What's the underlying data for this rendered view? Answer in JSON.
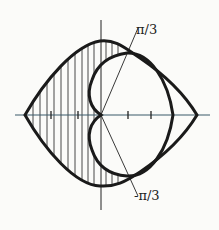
{
  "diagram": {
    "labels": {
      "upper_angle": "π/3",
      "lower_angle": "-π/3"
    },
    "colors": {
      "curve": "#1a1a1a",
      "axis_horizontal": "#3a5a6a",
      "hatching": "#333333",
      "background": "#fbfbf9"
    },
    "axis_ticks_count": 4
  }
}
